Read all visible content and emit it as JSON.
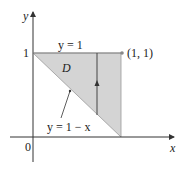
{
  "diagram": {
    "axes": {
      "x_label": "x",
      "y_label": "y",
      "origin_label": "0",
      "y_tick_label": "1"
    },
    "region": {
      "label": "D",
      "fill": "#d4d4d4"
    },
    "curves": {
      "top": {
        "label": "y = 1"
      },
      "bottom": {
        "label": "y = 1 − x"
      }
    },
    "point": {
      "label": "(1, 1)"
    }
  }
}
